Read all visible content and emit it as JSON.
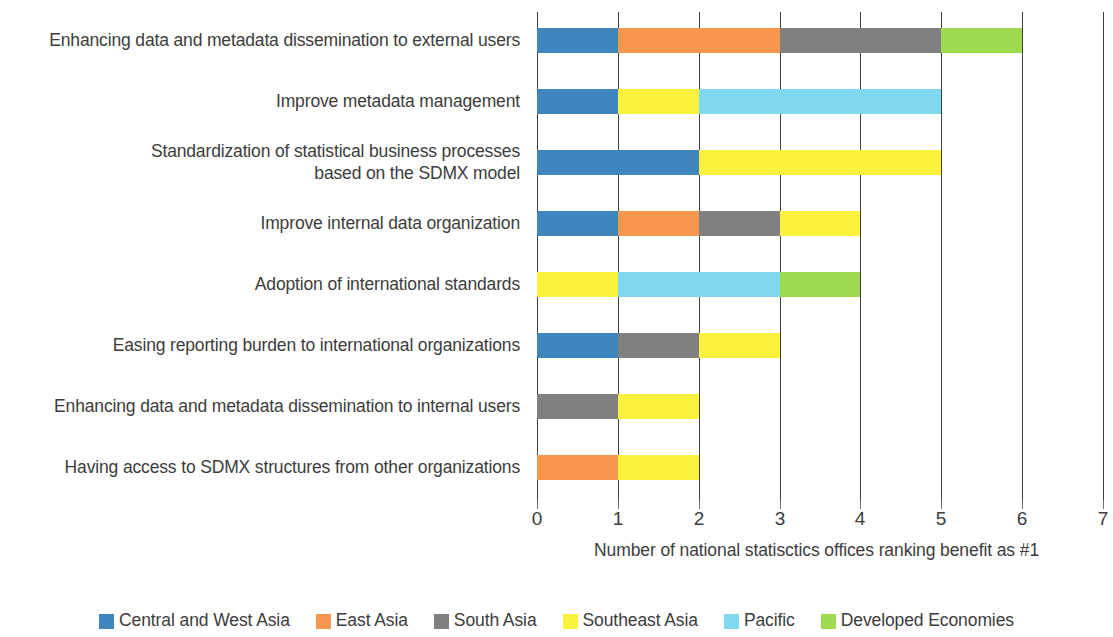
{
  "chart_data": {
    "type": "bar",
    "orientation": "horizontal",
    "stacked": true,
    "title": "",
    "xlabel": "Number of national statisctics offices ranking benefit as #1",
    "ylabel": "",
    "xlim": [
      0,
      7
    ],
    "xticks": [
      "0",
      "1",
      "2",
      "3",
      "4",
      "5",
      "6",
      "7"
    ],
    "grid": "vertical",
    "legend_position": "bottom",
    "categories": [
      "Enhancing data and metadata dissemination to external users",
      "Improve metadata management",
      "Standardization of statistical business processes based on the SDMX model",
      "Improve internal data organization",
      "Adoption of international standards",
      "Easing reporting burden to international organizations",
      "Enhancing data and metadata dissemination to internal users",
      "Having access to SDMX structures from other organizations"
    ],
    "category_lines": [
      [
        "Enhancing data and metadata dissemination to external users"
      ],
      [
        "Improve metadata management"
      ],
      [
        "Standardization of statistical business processes",
        "based on the SDMX model"
      ],
      [
        "Improve internal data organization"
      ],
      [
        "Adoption of international standards"
      ],
      [
        "Easing reporting burden to international organizations"
      ],
      [
        "Enhancing data and metadata dissemination to internal users"
      ],
      [
        "Having access to SDMX structures from other organizations"
      ]
    ],
    "series": [
      {
        "name": "Central and West Asia",
        "color": "#3E86BD",
        "values": [
          1,
          1,
          2,
          1,
          0,
          1,
          0,
          0
        ]
      },
      {
        "name": "East Asia",
        "color": "#F7974E",
        "values": [
          2,
          0,
          0,
          1,
          0,
          0,
          0,
          1
        ]
      },
      {
        "name": "South Asia",
        "color": "#808080",
        "values": [
          2,
          0,
          0,
          1,
          0,
          1,
          1,
          0
        ]
      },
      {
        "name": "Southeast Asia",
        "color": "#FAF23C",
        "values": [
          0,
          1,
          3,
          1,
          1,
          1,
          1,
          1
        ]
      },
      {
        "name": "Pacific",
        "color": "#7FD7F0",
        "values": [
          0,
          3,
          0,
          0,
          2,
          0,
          0,
          0
        ]
      },
      {
        "name": "Developed Economies",
        "color": "#9ED94F",
        "values": [
          1,
          0,
          0,
          0,
          1,
          0,
          0,
          0
        ]
      }
    ],
    "totals": [
      6,
      5,
      5,
      4,
      4,
      3,
      2,
      2
    ],
    "stack_order_per_category": [
      [
        [
          "Central and West Asia",
          1
        ],
        [
          "East Asia",
          2
        ],
        [
          "South Asia",
          2
        ],
        [
          "Developed Economies",
          1
        ]
      ],
      [
        [
          "Central and West Asia",
          1
        ],
        [
          "Southeast Asia",
          1
        ],
        [
          "Pacific",
          3
        ]
      ],
      [
        [
          "Central and West Asia",
          2
        ],
        [
          "Southeast Asia",
          3
        ]
      ],
      [
        [
          "Central and West Asia",
          1
        ],
        [
          "East Asia",
          1
        ],
        [
          "South Asia",
          1
        ],
        [
          "Southeast Asia",
          1
        ]
      ],
      [
        [
          "Southeast Asia",
          1
        ],
        [
          "Pacific",
          2
        ],
        [
          "Developed Economies",
          1
        ]
      ],
      [
        [
          "Central and West Asia",
          1
        ],
        [
          "South Asia",
          1
        ],
        [
          "Southeast Asia",
          1
        ]
      ],
      [
        [
          "South Asia",
          1
        ],
        [
          "Southeast Asia",
          1
        ]
      ],
      [
        [
          "East Asia",
          1
        ],
        [
          "Southeast Asia",
          1
        ]
      ]
    ]
  },
  "legend": {
    "items": [
      {
        "label": "Central and West Asia",
        "color": "#3E86BD"
      },
      {
        "label": "East Asia",
        "color": "#F7974E"
      },
      {
        "label": "South Asia",
        "color": "#808080"
      },
      {
        "label": "Southeast Asia",
        "color": "#FAF23C"
      },
      {
        "label": "Pacific",
        "color": "#7FD7F0"
      },
      {
        "label": "Developed Economies",
        "color": "#9ED94F"
      }
    ]
  },
  "axis": {
    "x_title": "Number of national statisctics offices ranking benefit as #1",
    "x_tick_labels": [
      "0",
      "1",
      "2",
      "3",
      "4",
      "5",
      "6",
      "7"
    ]
  }
}
